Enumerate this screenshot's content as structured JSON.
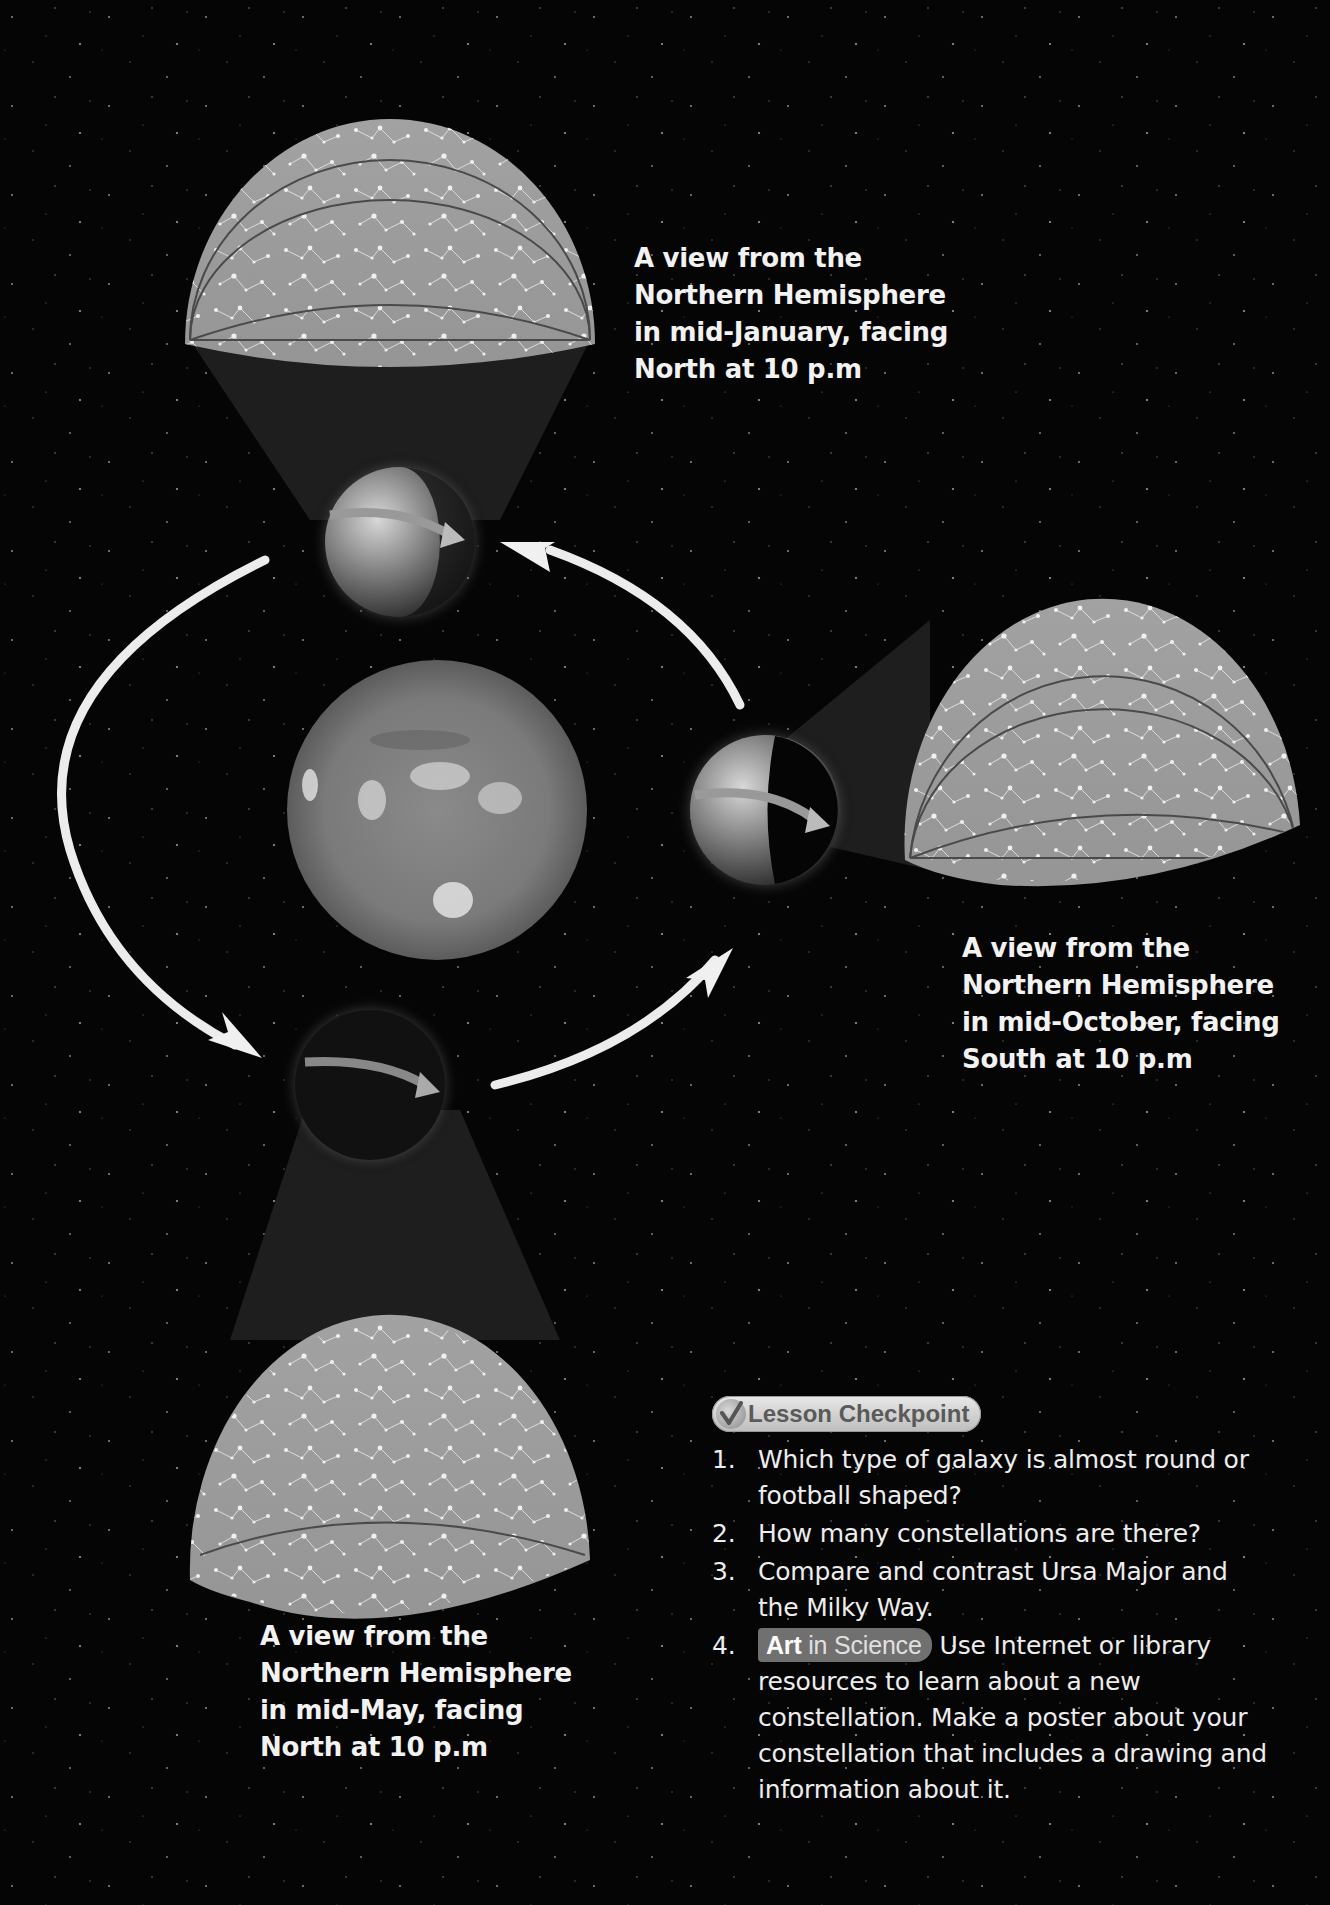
{
  "diagram": {
    "topic": "Constellations seen from Earth at different points in its orbit around the Sun",
    "center_body": "sun",
    "orbit_direction": "counterclockwise",
    "earth_positions": [
      "top",
      "right",
      "bottom"
    ]
  },
  "captions": {
    "january": {
      "lines": [
        "A view from the",
        "Northern Hemisphere",
        "in mid-January, facing",
        "North at 10 p.m"
      ]
    },
    "october": {
      "lines": [
        "A view from the",
        "Northern Hemisphere",
        "in mid-October, facing",
        "South at 10 p.m"
      ]
    },
    "may": {
      "lines": [
        "A view from the",
        "Northern Hemisphere",
        "in mid-May, facing",
        "North at 10 p.m"
      ]
    }
  },
  "checkpoint": {
    "badge_icon": "checkmark-icon",
    "title": "Lesson Checkpoint",
    "questions": [
      {
        "number": "1.",
        "text": "Which type of galaxy is almost round or football shaped?"
      },
      {
        "number": "2.",
        "text": "How many constellations are there?"
      },
      {
        "number": "3.",
        "text": "Compare and contrast Ursa Major and the Milky Way."
      },
      {
        "number": "4.",
        "tag_bold": "Art",
        "tag_rest": " in Science",
        "text": "Use Internet or library resources to learn about a new constellation. Make a poster about your constellation that includes a drawing and information about it."
      }
    ]
  },
  "colors": {
    "background": "#050505",
    "sky_dome": "#9c9c9c",
    "text": "#f2f2f2",
    "badge": "#d0d0d0",
    "tag": "#707070"
  }
}
